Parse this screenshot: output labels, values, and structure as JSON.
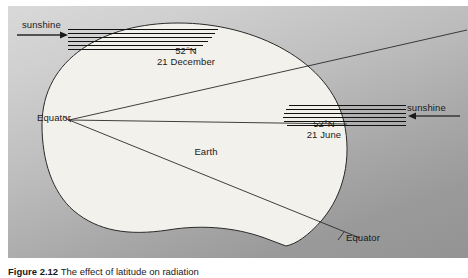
{
  "figure": {
    "caption_label": "Figure 2.12",
    "caption_text": "The effect of latitude on radiation",
    "background_light": "#d9d9d9",
    "background_dark": "#939393",
    "earth_fill": "#f2f1ec",
    "line_color": "#2a2a2a"
  },
  "labels": {
    "sunshine_left": "sunshine",
    "sunshine_right": "sunshine",
    "earth": "Earth",
    "equator_left": "Equator",
    "equator_right": "Equator",
    "december_latitude": "52°N",
    "december_date": "21 December",
    "june_latitude": "52°N",
    "june_date": "21 June"
  },
  "ray_bundles": {
    "left": {
      "count": 6,
      "direction": "right",
      "arrow": "→"
    },
    "right": {
      "count": 6,
      "direction": "left",
      "arrow": "←"
    }
  }
}
